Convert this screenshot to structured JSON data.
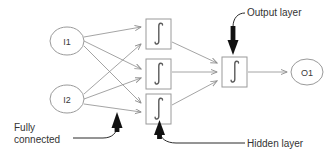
{
  "diagram": {
    "colors": {
      "background": "#ffffff",
      "shape_stroke": "#9a9a9a",
      "connection_stroke": "#8d8d8d",
      "leader_stroke": "#2b2b2b",
      "pointer_fill": "#111111",
      "text": "#333333"
    },
    "input_layer": {
      "name": "input-layer",
      "nodes": [
        {
          "id": "I1",
          "label": "I1",
          "cx": 67,
          "cy": 41,
          "rx": 17,
          "ry": 14
        },
        {
          "id": "I2",
          "label": "I2",
          "cx": 67,
          "cy": 99,
          "rx": 17,
          "ry": 14
        }
      ]
    },
    "hidden_layer": {
      "name": "hidden-layer",
      "label": "Hidden layer",
      "glyph": "integral-sigmoid",
      "units": [
        {
          "id": "H1",
          "x": 146,
          "y": 19,
          "w": 25,
          "h": 30
        },
        {
          "id": "H2",
          "x": 146,
          "y": 59,
          "w": 25,
          "h": 30
        },
        {
          "id": "H3",
          "x": 146,
          "y": 94,
          "w": 25,
          "h": 30
        }
      ]
    },
    "output_layer": {
      "name": "output-layer",
      "label": "Output layer",
      "glyph": "integral-sigmoid",
      "unit": {
        "id": "OUT",
        "x": 222,
        "y": 57,
        "w": 25,
        "h": 30
      }
    },
    "output_node": {
      "id": "O1",
      "label": "O1",
      "cx": 307,
      "cy": 72,
      "rx": 16,
      "ry": 13
    },
    "annotations": [
      {
        "id": "fully-connected",
        "line1": "Fully",
        "line2": "connected",
        "text": "Fully connected",
        "points_to": "input-to-hidden-connections"
      },
      {
        "id": "hidden-layer-annotation",
        "text": "Hidden layer",
        "points_to": "hidden-layer"
      },
      {
        "id": "output-layer-annotation",
        "text": "Output layer",
        "points_to": "output-layer"
      }
    ],
    "connections": {
      "input_to_hidden": [
        {
          "from": "I1",
          "to": "H1"
        },
        {
          "from": "I1",
          "to": "H2"
        },
        {
          "from": "I1",
          "to": "H3"
        },
        {
          "from": "I2",
          "to": "H1"
        },
        {
          "from": "I2",
          "to": "H2"
        },
        {
          "from": "I2",
          "to": "H3"
        }
      ],
      "hidden_to_output": [
        {
          "from": "H1",
          "to": "OUT"
        },
        {
          "from": "H2",
          "to": "OUT"
        },
        {
          "from": "H3",
          "to": "OUT"
        }
      ],
      "output_to_node": [
        {
          "from": "OUT",
          "to": "O1"
        }
      ]
    }
  }
}
